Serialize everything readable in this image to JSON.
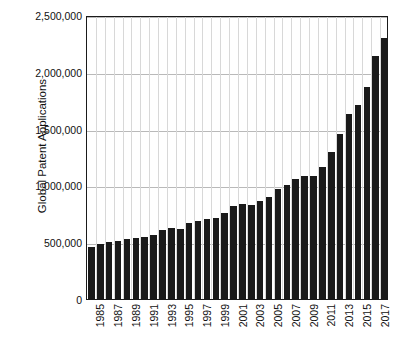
{
  "chart_data": {
    "type": "bar",
    "title": "",
    "subtitle": "",
    "xlabel": "",
    "ylabel": "Global Patent Applications",
    "ylim": [
      0,
      2500000
    ],
    "ytick_values": [
      0,
      500000,
      1000000,
      1500000,
      2000000,
      2500000
    ],
    "ytick_labels": [
      "0",
      "500,000",
      "1,000,000",
      "1,500,000",
      "2,000,000",
      "2,500,000"
    ],
    "grid": "horizontal-and-vertical",
    "legend": "none",
    "bar_color": "#1a1a1a",
    "plot_background": "#ffffff",
    "frame_color": "#1a1a1a",
    "gridline_color": "#b9b9b9",
    "categories": [
      "1985",
      "1986",
      "1987",
      "1988",
      "1989",
      "1990",
      "1991",
      "1992",
      "1993",
      "1994",
      "1995",
      "1996",
      "1997",
      "1998",
      "1999",
      "2000",
      "2001",
      "2002",
      "2003",
      "2004",
      "2005",
      "2006",
      "2007",
      "2008",
      "2009",
      "2010",
      "2011",
      "2012",
      "2013",
      "2014",
      "2015",
      "2016",
      "2017",
      "2018"
    ],
    "xtick_labels_shown": [
      "1985",
      "1987",
      "1989",
      "1991",
      "1993",
      "1995",
      "1997",
      "1999",
      "2001",
      "2003",
      "2005",
      "2007",
      "2009",
      "2011",
      "2013",
      "2015",
      "2017"
    ],
    "values": [
      460000,
      480000,
      505000,
      515000,
      525000,
      540000,
      545000,
      560000,
      610000,
      625000,
      615000,
      670000,
      685000,
      700000,
      715000,
      755000,
      820000,
      835000,
      825000,
      860000,
      900000,
      965000,
      1000000,
      1055000,
      1080000,
      1080000,
      1160000,
      1290000,
      1455000,
      1625000,
      1710000,
      1865000,
      2140000,
      2170000
    ],
    "last_bar_value": 2300000,
    "note": "Values read from axis gridlines; final bar ~2,300,000"
  },
  "axis": {
    "y_title": "Global Patent Applications"
  }
}
